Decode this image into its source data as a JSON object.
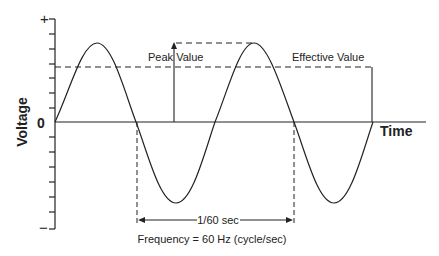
{
  "diagram": {
    "y_axis": {
      "label": "Voltage",
      "plus_label": "+",
      "zero_label": "0",
      "minus_label": "−"
    },
    "x_axis": {
      "label": "Time"
    },
    "annotations": {
      "peak_value": "Peak Value",
      "effective_value": "Effective Value",
      "period": "1/60 sec",
      "frequency": "Frequency = 60 Hz (cycle/sec)"
    },
    "colors": {
      "line": "#222222",
      "background": "#ffffff"
    }
  }
}
